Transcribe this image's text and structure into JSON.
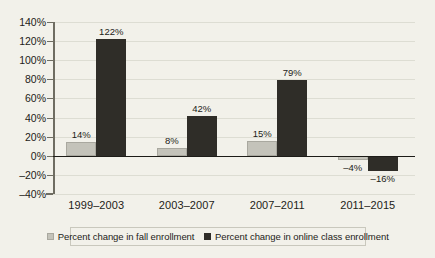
{
  "chart_data": {
    "type": "bar",
    "title": "",
    "subtitle": "",
    "xlabel": "",
    "ylabel": "",
    "categories": [
      "1999–2003",
      "2003–2007",
      "2007–2011",
      "2011–2015"
    ],
    "series": [
      {
        "name": "Percent change in fall enrollment",
        "color": "#c4c3ba",
        "values": [
          14,
          8,
          15,
          -4
        ],
        "labels": [
          "14%",
          "8%",
          "15%",
          "–4%"
        ]
      },
      {
        "name": "Percent change in online class enrollment",
        "color": "#2f2d28",
        "values": [
          122,
          42,
          79,
          -16
        ],
        "labels": [
          "122%",
          "42%",
          "79%",
          "–16%"
        ]
      }
    ],
    "ylim": [
      -40,
      140
    ],
    "yticks": [
      -40,
      -20,
      0,
      20,
      40,
      60,
      80,
      100,
      120,
      140
    ],
    "ytick_labels": [
      "–40%",
      "–20%",
      "0%",
      "20%",
      "40%",
      "60%",
      "80%",
      "100%",
      "120%",
      "140%"
    ],
    "grid": true,
    "legend_position": "bottom"
  },
  "legend": {
    "items": [
      {
        "label": "Percent change in fall enrollment",
        "swatch": "light"
      },
      {
        "label": "Percent change in online class enrollment",
        "swatch": "dark"
      }
    ]
  },
  "colors": {
    "background": "#f2f1ea",
    "series_light": "#c4c3ba",
    "series_dark": "#2f2d28",
    "gridline": "#ddddd3",
    "axis": "#6f6d62",
    "text": "#1d1c18"
  }
}
